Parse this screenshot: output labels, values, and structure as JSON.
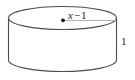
{
  "figure": {
    "name": "cylinder-diagram",
    "shape": "cylinder",
    "background_color": "#ffffff",
    "stroke_color": "#4d4d4d",
    "text_color": "#1a1a1a",
    "labels": {
      "radius_variable": "x",
      "radius_operator": "−",
      "radius_constant": "1",
      "radius_full": "x − 1",
      "height": "1"
    },
    "geometry": {
      "top_ellipse_center_x": 62.5,
      "top_ellipse_center_y": 18,
      "top_ellipse_rx": 54,
      "top_ellipse_ry": 12,
      "side_left_x": 8.5,
      "side_right_x": 116.5,
      "side_top_y": 18,
      "side_bottom_y": 60,
      "bottom_arc_depth_y": 71,
      "center_dot_x": 63,
      "center_dot_y": 20,
      "radius_line_x1": 63,
      "radius_line_x2": 116,
      "radius_line_y": 20
    }
  }
}
